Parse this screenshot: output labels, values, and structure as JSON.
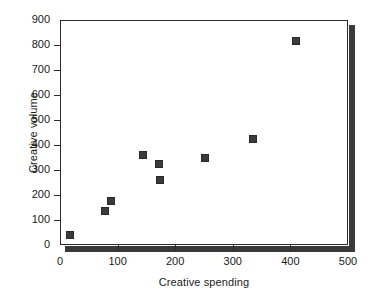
{
  "chart_data": {
    "type": "scatter",
    "title": "",
    "xlabel": "Creative spending",
    "ylabel": "Creative volume",
    "xlim": [
      0,
      500
    ],
    "ylim": [
      0,
      900
    ],
    "xticks": [
      0,
      100,
      200,
      300,
      400,
      500
    ],
    "yticks": [
      0,
      100,
      200,
      300,
      400,
      500,
      600,
      700,
      800,
      900
    ],
    "xtick_labels": [
      "0",
      "100",
      "200",
      "300",
      "400",
      "500"
    ],
    "ytick_labels": [
      "0",
      "100",
      "200",
      "300",
      "400",
      "500",
      "600",
      "700",
      "800",
      "900"
    ],
    "grid": false,
    "legend": null,
    "marker_color": "#3b3b3b",
    "marker_shape": "square",
    "points": [
      {
        "x": 17,
        "y": 40
      },
      {
        "x": 78,
        "y": 135
      },
      {
        "x": 88,
        "y": 175
      },
      {
        "x": 144,
        "y": 360
      },
      {
        "x": 172,
        "y": 325
      },
      {
        "x": 173,
        "y": 260
      },
      {
        "x": 252,
        "y": 348
      },
      {
        "x": 335,
        "y": 425
      },
      {
        "x": 410,
        "y": 815
      }
    ]
  }
}
